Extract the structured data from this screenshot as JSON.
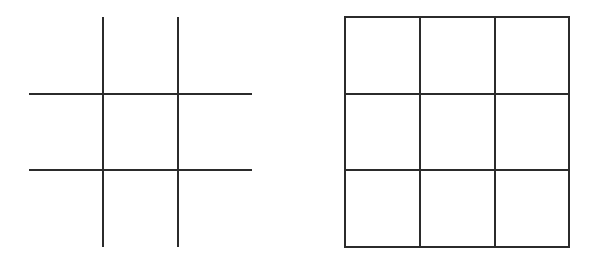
{
  "figures": [
    {
      "id": "open-grid",
      "description": "Tic-tac-toe style grid without outer border",
      "vertical_lines": [
        {
          "x": 103,
          "y1": 17,
          "y2": 247
        },
        {
          "x": 178,
          "y1": 17,
          "y2": 247
        }
      ],
      "horizontal_lines": [
        {
          "y": 94,
          "x1": 29,
          "x2": 252
        },
        {
          "y": 170,
          "x1": 29,
          "x2": 252
        }
      ]
    },
    {
      "id": "closed-grid",
      "description": "3x3 grid with outer border",
      "border": {
        "x": 345,
        "y": 17,
        "width": 224,
        "height": 230
      },
      "vertical_lines": [
        {
          "x": 420,
          "y1": 17,
          "y2": 247
        },
        {
          "x": 495,
          "y1": 17,
          "y2": 247
        }
      ],
      "horizontal_lines": [
        {
          "y": 94,
          "x1": 345,
          "x2": 569
        },
        {
          "y": 170,
          "x1": 345,
          "x2": 569
        }
      ]
    }
  ],
  "colors": {
    "line": "#2b2b2b",
    "background": "#ffffff"
  }
}
